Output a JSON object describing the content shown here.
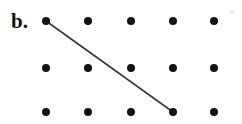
{
  "figure": {
    "label": "b.",
    "corner_mark": "*",
    "background_color": "#ffffff",
    "dot_color": "#131313",
    "line_color": "#3a3a3a",
    "corner_mark_color": "#d7d7d7",
    "width": 242,
    "height": 124
  },
  "chart_data": {
    "type": "scatter",
    "title": "b.",
    "xlabel": "",
    "ylabel": "",
    "grid": false,
    "legend": null,
    "xlim": [
      0,
      242
    ],
    "ylim": [
      124,
      0
    ],
    "columns_x": [
      46,
      88,
      131,
      173,
      214
    ],
    "rows_y": [
      21,
      68,
      112
    ],
    "dot_radius": 4,
    "points": [
      {
        "col": 1,
        "row": 1,
        "x": 46,
        "y": 21
      },
      {
        "col": 2,
        "row": 1,
        "x": 88,
        "y": 21
      },
      {
        "col": 3,
        "row": 1,
        "x": 131,
        "y": 21
      },
      {
        "col": 4,
        "row": 1,
        "x": 173,
        "y": 21
      },
      {
        "col": 5,
        "row": 1,
        "x": 214,
        "y": 21
      },
      {
        "col": 1,
        "row": 2,
        "x": 46,
        "y": 68
      },
      {
        "col": 2,
        "row": 2,
        "x": 88,
        "y": 68
      },
      {
        "col": 3,
        "row": 2,
        "x": 131,
        "y": 68
      },
      {
        "col": 4,
        "row": 2,
        "x": 173,
        "y": 68
      },
      {
        "col": 5,
        "row": 2,
        "x": 214,
        "y": 68
      },
      {
        "col": 1,
        "row": 3,
        "x": 46,
        "y": 112
      },
      {
        "col": 2,
        "row": 3,
        "x": 88,
        "y": 112
      },
      {
        "col": 3,
        "row": 3,
        "x": 131,
        "y": 112
      },
      {
        "col": 4,
        "row": 3,
        "x": 173,
        "y": 112
      },
      {
        "col": 5,
        "row": 3,
        "x": 214,
        "y": 112
      }
    ],
    "segments": [
      {
        "name": "diagonal-segment",
        "from": {
          "col": 1,
          "row": 1,
          "x": 46,
          "y": 21
        },
        "to": {
          "col": 4,
          "row": 3,
          "x": 173,
          "y": 112
        }
      }
    ],
    "annotations": [
      {
        "name": "corner-asterisk",
        "text": "*",
        "x": 229,
        "y": 8
      }
    ]
  }
}
